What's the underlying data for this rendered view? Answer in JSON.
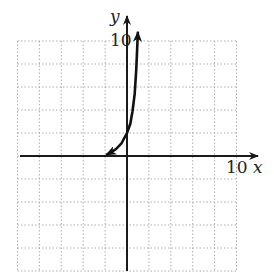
{
  "chart_data": {
    "type": "line",
    "title": "",
    "xlabel": "x",
    "ylabel": "y",
    "x_tick_label": "10",
    "y_tick_label": "10",
    "xlim": [
      -10,
      10
    ],
    "ylim": [
      -10,
      10
    ],
    "grid": true,
    "grid_step": 2,
    "legend": null,
    "series": [
      {
        "name": "exponential curve",
        "x": [
          -1.9,
          -1.5,
          -1.0,
          -0.5,
          0.0,
          0.3,
          0.5,
          0.7,
          0.85,
          1.0
        ],
        "y": [
          0.1,
          0.3,
          0.6,
          1.1,
          2.0,
          2.8,
          3.9,
          5.4,
          7.6,
          10.8
        ],
        "arrows": "both"
      }
    ]
  },
  "labels": {
    "x_axis": "x",
    "y_axis": "y",
    "x_tick": "10",
    "y_tick": "10"
  },
  "colors": {
    "axis": "#1a1a1a",
    "curve": "#111111",
    "grid": "#9a9a9a"
  }
}
